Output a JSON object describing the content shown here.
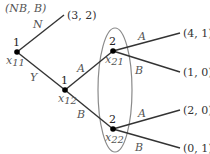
{
  "title": "(NB, B)",
  "nodes": {
    "x11": {
      "player": "1",
      "name": "x",
      "sub": "11"
    },
    "x12": {
      "player": "1",
      "name": "x",
      "sub": "12"
    },
    "x21": {
      "player": "2",
      "name": "x",
      "sub": "21"
    },
    "x22": {
      "player": "2",
      "name": "x",
      "sub": "22"
    }
  },
  "edges": {
    "x11_N": "N",
    "x11_Y": "Y",
    "x12_A": "A",
    "x12_B": "B",
    "x21_A": "A",
    "x21_B": "B",
    "x22_A": "A",
    "x22_B": "B"
  },
  "payoffs": {
    "N": "(3, 2)",
    "AA": "(4, 1)",
    "AB": "(1, 0)",
    "BA": "(2, 0)",
    "BB": "(0, 1)"
  },
  "colors": {
    "line": "#333333",
    "ellipse": "#888888",
    "node": "#000000"
  }
}
